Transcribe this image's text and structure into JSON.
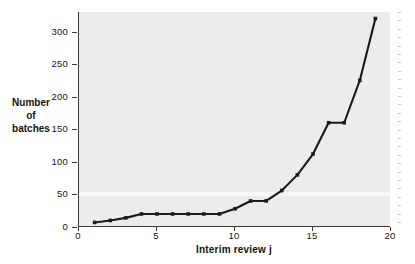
{
  "chart_data": {
    "type": "line",
    "title": "",
    "xlabel": "Interim review j",
    "ylabel": "Number\nof\nbatches",
    "ylabel_lines": [
      "Number",
      "of",
      "batches"
    ],
    "x": [
      1,
      2,
      3,
      4,
      5,
      6,
      7,
      8,
      9,
      10,
      11,
      12,
      13,
      14,
      15,
      16,
      17,
      18,
      19
    ],
    "values": [
      7,
      10,
      14,
      20,
      20,
      20,
      20,
      20,
      20,
      28,
      40,
      40,
      56,
      80,
      112,
      160,
      160,
      225,
      320
    ],
    "series": [
      {
        "name": "Number of batches",
        "values": [
          7,
          10,
          14,
          20,
          20,
          20,
          20,
          20,
          20,
          28,
          40,
          40,
          56,
          80,
          112,
          160,
          160,
          225,
          320
        ]
      }
    ],
    "xlim": [
      0,
      20
    ],
    "ylim": [
      0,
      330
    ],
    "xticks": [
      0,
      5,
      10,
      15,
      20
    ],
    "yticks": [
      0,
      50,
      100,
      150,
      200,
      250,
      300
    ],
    "xtick_labels": [
      "0",
      "5",
      "10",
      "15",
      "20"
    ],
    "ytick_labels": [
      "0",
      "50",
      "100",
      "150",
      "200",
      "250",
      "300"
    ],
    "grid": false,
    "legend": "none",
    "marker": "square",
    "line_color": "#1a1a1a",
    "plot_background": "#ececec",
    "page_background": "#ffffff",
    "axis_color": "#3a3a3a"
  }
}
